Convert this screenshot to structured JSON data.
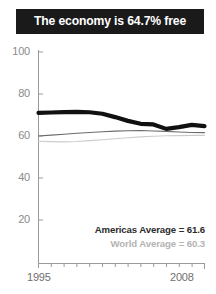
{
  "header": {
    "title": "The economy is 64.7% free"
  },
  "legend": {
    "americas": "Americas Average = 61.6",
    "world": "World Average = 60.3"
  },
  "axis": {
    "y_ticks": [
      "100",
      "80",
      "60",
      "40",
      "20"
    ],
    "x_start": "1995",
    "x_end": "2008"
  },
  "colors": {
    "banner_background": "#1a1a1a",
    "banner_text": "#ffffff",
    "country_line": "#111111",
    "americas_line": "#6b6b6b",
    "world_line": "#cccccc",
    "axis": "#9a9a9a",
    "tick_label": "#8a8a8a"
  },
  "chart_data": {
    "type": "line",
    "title": "The economy is 64.7% free",
    "xlabel": "",
    "ylabel": "",
    "xlim": [
      1995,
      2008
    ],
    "ylim": [
      0,
      100
    ],
    "yticks": [
      20,
      40,
      60,
      80,
      100
    ],
    "xticks": [
      1995,
      1996,
      1997,
      1998,
      1999,
      2000,
      2001,
      2002,
      2003,
      2004,
      2005,
      2006,
      2007,
      2008
    ],
    "grid": false,
    "legend_position": "inside-lower-right",
    "x": [
      1995,
      1996,
      1997,
      1998,
      1999,
      2000,
      2001,
      2002,
      2003,
      2004,
      2005,
      2006,
      2007,
      2008
    ],
    "series": [
      {
        "name": "Country",
        "color": "#111111",
        "width": "thick",
        "values": [
          71.0,
          71.2,
          71.4,
          71.5,
          71.3,
          70.6,
          69.0,
          67.2,
          65.8,
          65.5,
          63.4,
          64.2,
          65.3,
          64.7
        ]
      },
      {
        "name": "Americas Average",
        "color": "#6b6b6b",
        "width": "thin",
        "final_label": 61.6,
        "values": [
          60.0,
          60.4,
          60.8,
          61.3,
          61.7,
          62.0,
          62.3,
          62.5,
          62.6,
          62.4,
          62.2,
          61.9,
          61.7,
          61.6
        ]
      },
      {
        "name": "World Average",
        "color": "#cccccc",
        "width": "thin",
        "final_label": 60.3,
        "values": [
          57.5,
          57.3,
          57.2,
          57.4,
          57.8,
          58.2,
          58.7,
          59.2,
          59.6,
          59.9,
          60.1,
          60.2,
          60.3,
          60.3
        ]
      }
    ]
  }
}
